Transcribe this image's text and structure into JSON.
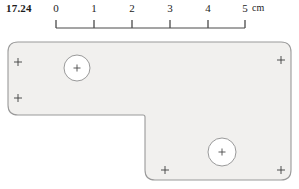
{
  "figure": {
    "label": "17.24"
  },
  "scale": {
    "unit_label": "cm",
    "ticks": [
      {
        "value": "0",
        "x": 56
      },
      {
        "value": "1",
        "x": 94
      },
      {
        "value": "2",
        "x": 132
      },
      {
        "value": "3",
        "x": 170
      },
      {
        "value": "4",
        "x": 208
      },
      {
        "value": "5",
        "x": 245
      }
    ],
    "axis_y": 20,
    "tick_height": 8,
    "x_start": 56,
    "x_end": 245,
    "unit_x": 252,
    "color": "#4a4a4a"
  },
  "part": {
    "name": "l-shaped-bracket",
    "fill_color": "#f1f0ee",
    "stroke_color": "#9a9a9a",
    "outline_points": "L-shape with rounded corners",
    "corner_radius": 10,
    "bounds": {
      "left": 8,
      "top": 42,
      "right": 291,
      "bottom": 180
    },
    "notch": {
      "x": 145,
      "y": 115
    },
    "holes": [
      {
        "name": "hole-upper-left",
        "cx": 77,
        "cy": 68,
        "r": 13
      },
      {
        "name": "hole-lower-right",
        "cx": 222,
        "cy": 152,
        "r": 14
      }
    ],
    "datum_marks": [
      {
        "name": "datum-top-left",
        "x": 18,
        "y": 62
      },
      {
        "name": "datum-mid-left",
        "x": 18,
        "y": 98
      },
      {
        "name": "datum-top-right",
        "x": 281,
        "y": 60
      },
      {
        "name": "datum-bottom-left",
        "x": 165,
        "y": 170
      },
      {
        "name": "datum-bottom-right",
        "x": 281,
        "y": 170
      }
    ],
    "mark_size": 4
  }
}
